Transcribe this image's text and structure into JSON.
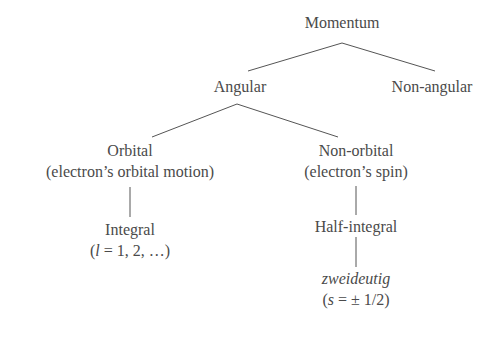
{
  "diagram": {
    "nodes": {
      "root": {
        "label": "Momentum"
      },
      "angular": {
        "label": "Angular"
      },
      "non_angular": {
        "label": "Non-angular"
      },
      "orbital": {
        "label": "Orbital",
        "sublabel": "(electron’s orbital motion)"
      },
      "non_orbital": {
        "label": "Non-orbital",
        "sublabel": "(electron’s spin)"
      },
      "integral": {
        "label": "Integral",
        "formula_var": "l",
        "formula_rest": " = 1, 2, …)",
        "formula_open": "("
      },
      "half_integral": {
        "label": "Half-integral"
      },
      "zweideutig": {
        "label": "zweideutig",
        "formula_open": "(",
        "formula_var": "s",
        "formula_rest": " = ± 1/2)"
      }
    },
    "edges": [
      [
        "root",
        "angular"
      ],
      [
        "root",
        "non_angular"
      ],
      [
        "angular",
        "orbital"
      ],
      [
        "angular",
        "non_orbital"
      ],
      [
        "orbital",
        "integral"
      ],
      [
        "non_orbital",
        "half_integral"
      ],
      [
        "half_integral",
        "zweideutig"
      ]
    ],
    "colors": {
      "text": "#4a4a4a",
      "line": "#555555",
      "background": "#ffffff"
    }
  }
}
